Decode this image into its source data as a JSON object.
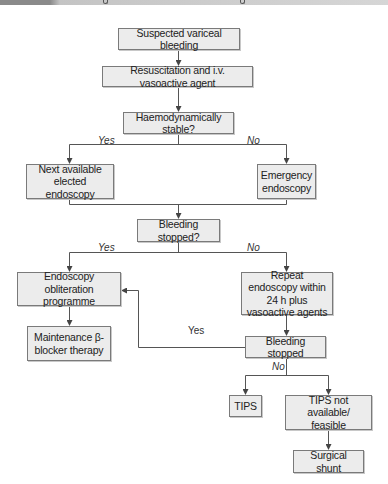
{
  "header": {
    "bar_colors": {
      "left": "#8a8a8a",
      "right": "#d6d6d6"
    }
  },
  "colors": {
    "box_fill": "#ececec",
    "box_border": "#7a7a7a",
    "connector": "#555555"
  },
  "nodes": {
    "suspected": "Suspected variceal bleeding",
    "resuscitation": "Resuscitation and i.v. vasoactive agent",
    "haemo_stable": "Haemodynamically stable?",
    "next_endoscopy": "Next available elected endoscopy",
    "emergency_endoscopy": "Emergency endoscopy",
    "bleeding_stopped_q": "Bleeding stopped?",
    "obliteration": "Endoscopy obliteration programme",
    "maintenance": "Maintenance β-blocker therapy",
    "repeat_endoscopy": "Repeat endoscopy within 24 h plus vasoactive agents",
    "bleeding_stopped": "Bleeding stopped",
    "tips": "TIPS",
    "tips_not_available": "TIPS not available/ feasible",
    "surgical_shunt": "Surgical shunt"
  },
  "edge_labels": {
    "haemo_yes": "Yes",
    "haemo_no": "No",
    "stopped_yes": "Yes",
    "stopped_no": "No",
    "loop_yes": "Yes",
    "final_no": "No"
  }
}
